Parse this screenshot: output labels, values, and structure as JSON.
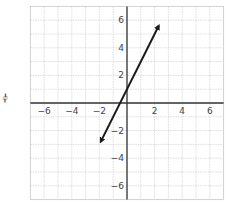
{
  "side_mark": "⫩",
  "chart_data": {
    "type": "line",
    "title": "",
    "xlabel": "",
    "ylabel": "",
    "xlim": [
      -7,
      7
    ],
    "ylim": [
      -7,
      7
    ],
    "grid": true,
    "x_ticks": [
      -6,
      -4,
      -2,
      2,
      4,
      6
    ],
    "y_ticks": [
      6,
      4,
      2,
      -2,
      -4,
      -6
    ],
    "series": [
      {
        "name": "y = 2x + 1",
        "equation": "y = 2x + 1",
        "slope": 2,
        "intercept": 1,
        "arrows": "both",
        "x": [
          -1.9,
          2.3
        ],
        "y": [
          -2.8,
          5.6
        ],
        "color": "#1a1a1a"
      }
    ]
  },
  "colors": {
    "axis": "#333333",
    "grid": "#cfcfcf",
    "line": "#1a1a1a",
    "tick_label": "#444444"
  }
}
